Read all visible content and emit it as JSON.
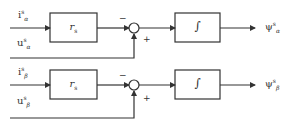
{
  "diagram": {
    "type": "block-diagram",
    "rows": [
      {
        "id": "alpha",
        "current_input": {
          "symbol": "i",
          "sup": "s",
          "sub": "α"
        },
        "voltage_input": {
          "symbol": "u",
          "sup": "s",
          "sub": "α"
        },
        "gain_block": {
          "symbol": "r",
          "sub": "s"
        },
        "summing_junction": {
          "minus_sign": "−",
          "plus_sign": "+"
        },
        "integrator_block": {
          "symbol": "∫"
        },
        "output": {
          "symbol": "ψ",
          "sup": "s",
          "sub": "α"
        }
      },
      {
        "id": "beta",
        "current_input": {
          "symbol": "i",
          "sup": "s",
          "sub": "β"
        },
        "voltage_input": {
          "symbol": "u",
          "sup": "s",
          "sub": "β"
        },
        "gain_block": {
          "symbol": "r",
          "sub": "s"
        },
        "summing_junction": {
          "minus_sign": "−",
          "plus_sign": "+"
        },
        "integrator_block": {
          "symbol": "∫"
        },
        "output": {
          "symbol": "ψ",
          "sup": "s",
          "sub": "β"
        }
      }
    ],
    "colors": {
      "line": "#333333",
      "background": "#ffffff"
    }
  }
}
